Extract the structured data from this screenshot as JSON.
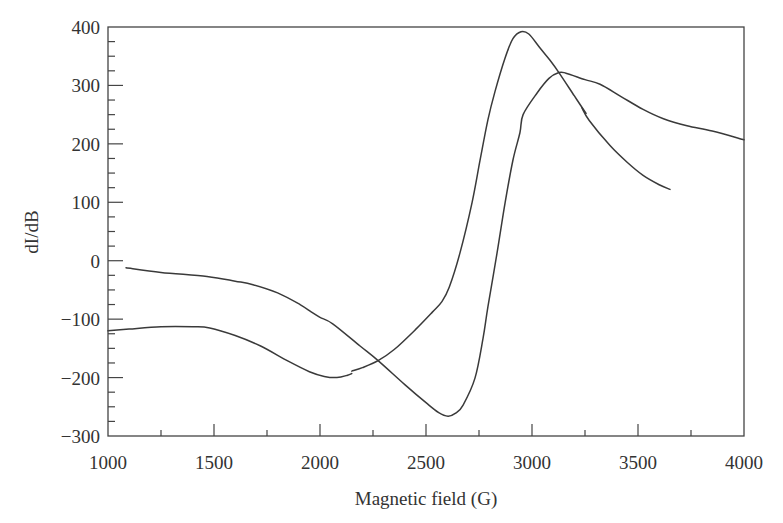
{
  "chart_data": {
    "type": "line",
    "title": "",
    "xlabel": "Magnetic field (G)",
    "ylabel": "dI/dB",
    "xlim": [
      1000,
      4000
    ],
    "ylim": [
      -300,
      400
    ],
    "x_ticks": [
      1000,
      1500,
      2000,
      2500,
      3000,
      3500,
      4000
    ],
    "x_tick_labels": [
      "1000",
      "1500",
      "2000",
      "2500",
      "3000",
      "3500",
      "4000"
    ],
    "x_minor_step": 250,
    "y_ticks": [
      -300,
      -200,
      -100,
      0,
      100,
      200,
      300,
      400
    ],
    "y_tick_labels": [
      "−300",
      "−200",
      "−100",
      "0",
      "100",
      "200",
      "300",
      "400"
    ],
    "y_minor_step": 25,
    "grid": false,
    "legend": null,
    "line_color": "#3a3a3a",
    "series": [
      {
        "name": "curve-1",
        "segments": [
          [
            [
              1000,
              -120
            ],
            [
              1100,
              -117
            ],
            [
              1250,
              -113
            ],
            [
              1400,
              -113
            ],
            [
              1480,
              -115
            ],
            [
              1600,
              -128
            ],
            [
              1720,
              -146
            ],
            [
              1850,
              -172
            ],
            [
              1950,
              -190
            ],
            [
              2020,
              -198
            ],
            [
              2080,
              -200
            ],
            [
              2130,
              -196
            ],
            [
              2150,
              -193
            ]
          ],
          [
            [
              2150,
              -189
            ],
            [
              2200,
              -183
            ],
            [
              2274,
              -171
            ],
            [
              2350,
              -152
            ],
            [
              2450,
              -118
            ],
            [
              2530,
              -88
            ],
            [
              2575,
              -70
            ],
            [
              2610,
              -45
            ],
            [
              2660,
              13
            ],
            [
              2717,
              99
            ],
            [
              2755,
              172
            ],
            [
              2792,
              241
            ],
            [
              2825,
              289
            ],
            [
              2873,
              347
            ],
            [
              2910,
              380
            ],
            [
              2948,
              392
            ],
            [
              2985,
              388
            ],
            [
              3038,
              364
            ],
            [
              3085,
              343
            ],
            [
              3127,
              322
            ],
            [
              3200,
              282
            ],
            [
              3255,
              252
            ]
          ],
          [
            [
              3235,
              262
            ],
            [
              3270,
              240
            ],
            [
              3368,
              197
            ],
            [
              3450,
              168
            ],
            [
              3524,
              146
            ],
            [
              3600,
              130
            ],
            [
              3651,
              122
            ]
          ]
        ]
      },
      {
        "name": "curve-2",
        "segments": [
          [
            [
              1085,
              -12
            ],
            [
              1250,
              -20
            ],
            [
              1467,
              -27
            ],
            [
              1600,
              -35
            ],
            [
              1684,
              -41
            ],
            [
              1800,
              -55
            ],
            [
              1906,
              -75
            ],
            [
              1960,
              -88
            ],
            [
              2000,
              -97
            ],
            [
              2060,
              -108
            ],
            [
              2189,
              -146
            ],
            [
              2274,
              -171
            ],
            [
              2400,
              -212
            ],
            [
              2500,
              -243
            ],
            [
              2560,
              -260
            ],
            [
              2604,
              -266
            ],
            [
              2640,
              -261
            ],
            [
              2675,
              -247
            ],
            [
              2731,
              -201
            ],
            [
              2769,
              -133
            ],
            [
              2792,
              -79
            ],
            [
              2835,
              13
            ],
            [
              2873,
              99
            ],
            [
              2910,
              172
            ],
            [
              2943,
              219
            ],
            [
              2958,
              250
            ],
            [
              3024,
              287
            ],
            [
              3080,
              312
            ],
            [
              3127,
              322
            ],
            [
              3160,
              321
            ],
            [
              3250,
              310
            ],
            [
              3321,
              302
            ],
            [
              3420,
              281
            ],
            [
              3524,
              259
            ],
            [
              3620,
              243
            ],
            [
              3731,
              231
            ],
            [
              3850,
              222
            ],
            [
              4000,
              207
            ]
          ]
        ]
      }
    ]
  }
}
